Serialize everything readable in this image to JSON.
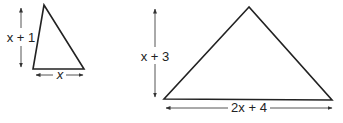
{
  "diagram": {
    "small_triangle": {
      "height_label": "x + 1",
      "base_label": "x"
    },
    "large_triangle": {
      "height_label": "x + 3",
      "base_label": "2x + 4"
    },
    "colors": {
      "stroke": "#222222",
      "arrow": "#444444",
      "background": "#ffffff"
    }
  }
}
